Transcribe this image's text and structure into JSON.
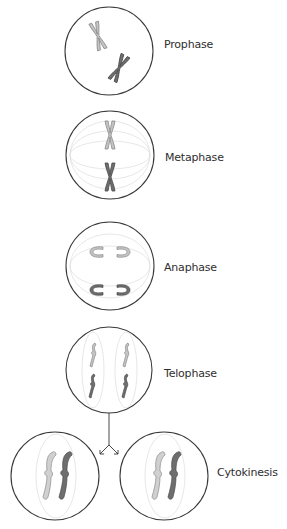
{
  "diagram": {
    "stages": [
      {
        "id": "prophase",
        "label": "Prophase"
      },
      {
        "id": "metaphase",
        "label": "Metaphase"
      },
      {
        "id": "anaphase",
        "label": "Anaphase"
      },
      {
        "id": "telophase",
        "label": "Telophase"
      },
      {
        "id": "cytokinesis",
        "label": "Cytokinesis"
      }
    ],
    "colors": {
      "cell_outline": "#3a3a3a",
      "spindle": "#d6d6d6",
      "chromosome_light": "#bdbdbd",
      "chromosome_light_outline": "#8a8a8a",
      "chromosome_dark": "#6e6e6e",
      "chromosome_dark_outline": "#4a4a4a",
      "label_text": "#2e2e2e"
    }
  }
}
